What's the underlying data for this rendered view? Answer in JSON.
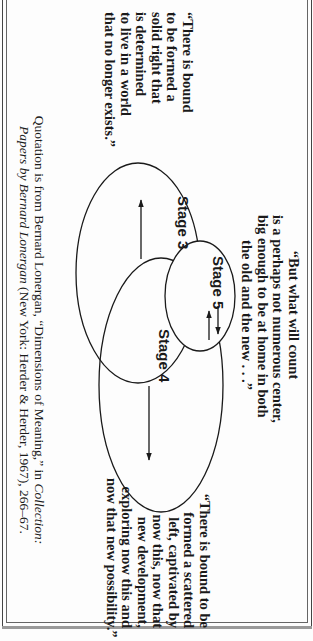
{
  "orientation": "rotated-90-clockwise",
  "quotes": {
    "left": {
      "lines": [
        "“There is bound",
        "to be formed a",
        "solid right that",
        "is determined",
        "to live in a world",
        "that no longer exists.”"
      ]
    },
    "top": {
      "lines": [
        "“But what will count",
        "is a perhaps not numerous center,",
        "big enough to be at home in both",
        "the old and the new . . .”"
      ]
    },
    "right": {
      "lines": [
        "“There is bound to be",
        "formed a scattered",
        "left, captivated by",
        "now this, now that",
        "new development,",
        "exploring now this and",
        "now that new possibility.”"
      ]
    }
  },
  "diagram": {
    "stages": [
      {
        "label": "Stage 3",
        "arrow": "left-pointing (toward past)"
      },
      {
        "label": "Stage 5",
        "arrow": "double (both directions)"
      },
      {
        "label": "Stage 4",
        "arrow": "right-pointing (toward future)"
      }
    ]
  },
  "citation": {
    "line1_prefix": "Quotation is from Bernard Lonergan, “Dimensions of Meaning,” in ",
    "line1_italic": "Collection:",
    "line2_italic": "Papers by Bernard Lonergan",
    "line2_suffix": " (New York: Herder & Herder, 1967), 266–67."
  },
  "colors": {
    "ink": "#1a1a1a",
    "paper": "#fdfdfd",
    "frame": "#555555"
  }
}
